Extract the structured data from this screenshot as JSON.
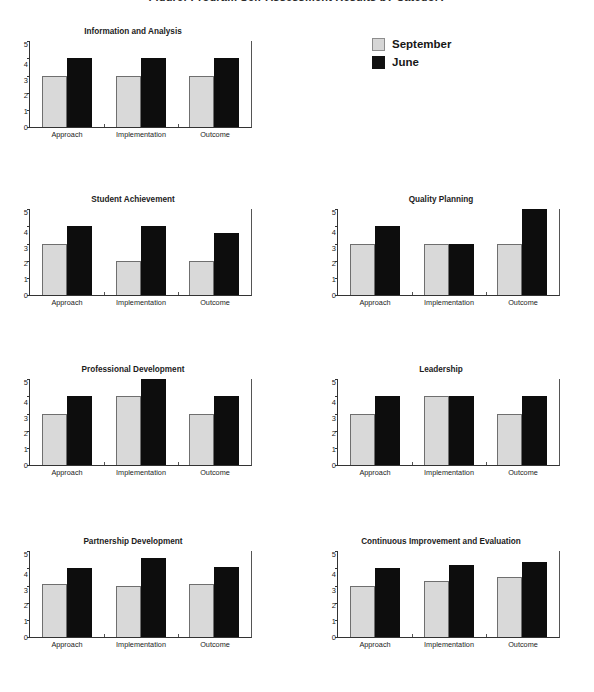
{
  "page": {
    "cut_off_title": "Figure: Program Self-Assessment Results by Category"
  },
  "legend": {
    "position": "top-right",
    "entries": [
      {
        "label": "September",
        "color": "#d9d9d9",
        "swatch": "september-swatch"
      },
      {
        "label": "June",
        "color": "#0d0d0d",
        "swatch": "june-swatch"
      }
    ]
  },
  "axis": {
    "yticks": [
      "5",
      "4",
      "3",
      "2",
      "1",
      "0"
    ],
    "ylim": [
      0,
      5
    ],
    "categories": [
      "Approach",
      "Implementation",
      "Outcome"
    ]
  },
  "chart_data": [
    {
      "type": "bar",
      "title": "Information and Analysis",
      "categories": [
        "Approach",
        "Implementation",
        "Outcome"
      ],
      "series": [
        {
          "name": "September",
          "values": [
            3,
            3,
            3
          ],
          "color": "#d9d9d9"
        },
        {
          "name": "June",
          "values": [
            4,
            4,
            4
          ],
          "color": "#0d0d0d"
        }
      ],
      "xlabel": "",
      "ylabel": "",
      "ylim": [
        0,
        5
      ],
      "grid": false,
      "legend_position": "top-right"
    },
    {
      "type": "bar",
      "title": "Student Achievement",
      "categories": [
        "Approach",
        "Implementation",
        "Outcome"
      ],
      "series": [
        {
          "name": "September",
          "values": [
            3,
            2,
            2
          ],
          "color": "#d9d9d9"
        },
        {
          "name": "June",
          "values": [
            4,
            4,
            3.6
          ],
          "color": "#0d0d0d"
        }
      ],
      "xlabel": "",
      "ylabel": "",
      "ylim": [
        0,
        5
      ],
      "grid": false,
      "legend_position": "none"
    },
    {
      "type": "bar",
      "title": "Quality Planning",
      "categories": [
        "Approach",
        "Implementation",
        "Outcome"
      ],
      "series": [
        {
          "name": "September",
          "values": [
            3,
            3,
            3
          ],
          "color": "#d9d9d9"
        },
        {
          "name": "June",
          "values": [
            4,
            3,
            5
          ],
          "color": "#0d0d0d"
        }
      ],
      "xlabel": "",
      "ylabel": "",
      "ylim": [
        0,
        5
      ],
      "grid": false,
      "legend_position": "none"
    },
    {
      "type": "bar",
      "title": "Professional Development",
      "categories": [
        "Approach",
        "Implementation",
        "Outcome"
      ],
      "series": [
        {
          "name": "September",
          "values": [
            3,
            4,
            3
          ],
          "color": "#d9d9d9"
        },
        {
          "name": "June",
          "values": [
            4,
            5,
            4
          ],
          "color": "#0d0d0d"
        }
      ],
      "xlabel": "",
      "ylabel": "",
      "ylim": [
        0,
        5
      ],
      "grid": false,
      "legend_position": "none"
    },
    {
      "type": "bar",
      "title": "Leadership",
      "categories": [
        "Approach",
        "Implementation",
        "Outcome"
      ],
      "series": [
        {
          "name": "September",
          "values": [
            3,
            4,
            3
          ],
          "color": "#d9d9d9"
        },
        {
          "name": "June",
          "values": [
            4,
            4,
            4
          ],
          "color": "#0d0d0d"
        }
      ],
      "xlabel": "",
      "ylabel": "",
      "ylim": [
        0,
        5
      ],
      "grid": false,
      "legend_position": "none"
    },
    {
      "type": "bar",
      "title": "Partnership Development",
      "categories": [
        "Approach",
        "Implementation",
        "Outcome"
      ],
      "series": [
        {
          "name": "September",
          "values": [
            3.1,
            3,
            3.1
          ],
          "color": "#d9d9d9"
        },
        {
          "name": "June",
          "values": [
            4,
            4.6,
            4.1
          ],
          "color": "#0d0d0d"
        }
      ],
      "xlabel": "",
      "ylabel": "",
      "ylim": [
        0,
        5
      ],
      "grid": false,
      "legend_position": "none"
    },
    {
      "type": "bar",
      "title": "Continuous Improvement and Evaluation",
      "categories": [
        "Approach",
        "Implementation",
        "Outcome"
      ],
      "series": [
        {
          "name": "September",
          "values": [
            3,
            3.25,
            3.5
          ],
          "color": "#d9d9d9"
        },
        {
          "name": "June",
          "values": [
            4,
            4.2,
            4.4
          ],
          "color": "#0d0d0d"
        }
      ],
      "xlabel": "",
      "ylabel": "",
      "ylim": [
        0,
        5
      ],
      "grid": false,
      "legend_position": "none"
    }
  ],
  "layout": {
    "panels": [
      {
        "chart_index": 0,
        "left": 14,
        "top": 28,
        "plot_width": 222,
        "plot_height": 86
      },
      {
        "chart_index": 1,
        "left": 14,
        "top": 196,
        "plot_width": 222,
        "plot_height": 86
      },
      {
        "chart_index": 2,
        "left": 322,
        "top": 196,
        "plot_width": 222,
        "plot_height": 86
      },
      {
        "chart_index": 3,
        "left": 14,
        "top": 366,
        "plot_width": 222,
        "plot_height": 86
      },
      {
        "chart_index": 4,
        "left": 322,
        "top": 366,
        "plot_width": 222,
        "plot_height": 86
      },
      {
        "chart_index": 5,
        "left": 14,
        "top": 538,
        "plot_width": 222,
        "plot_height": 86
      },
      {
        "chart_index": 6,
        "left": 322,
        "top": 538,
        "plot_width": 222,
        "plot_height": 86
      }
    ]
  }
}
